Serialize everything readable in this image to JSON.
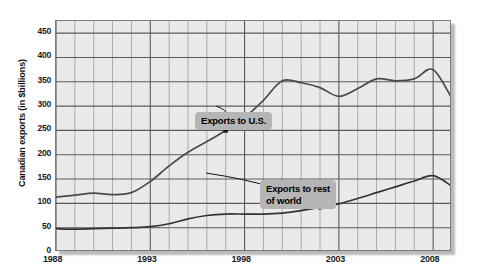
{
  "chart_data": {
    "type": "line",
    "title": "",
    "xlabel": "",
    "ylabel": "Canadian exports (in $billions)",
    "xlim": [
      1988,
      2009
    ],
    "ylim": [
      0,
      475
    ],
    "grid": true,
    "legend_position": "inline-callouts",
    "x": [
      1988,
      1989,
      1990,
      1991,
      1992,
      1993,
      1994,
      1995,
      1996,
      1997,
      1998,
      1999,
      2000,
      2001,
      2002,
      2003,
      2004,
      2005,
      2006,
      2007,
      2008,
      2009
    ],
    "y_ticks": [
      0,
      50,
      100,
      150,
      200,
      250,
      300,
      350,
      400,
      450
    ],
    "x_ticks": [
      1988,
      1993,
      1998,
      2003,
      2008
    ],
    "x_tick_labels": [
      "1988",
      "1993",
      "1998",
      "2003",
      "2008"
    ],
    "y_tick_labels": [
      "0",
      "50",
      "100",
      "150",
      "200",
      "250",
      "300",
      "350",
      "400",
      "450"
    ],
    "series": [
      {
        "name": "Exports to U.S.",
        "color": "#4a4a4a",
        "values": [
          113,
          117,
          121,
          118,
          122,
          145,
          177,
          205,
          227,
          250,
          276,
          312,
          352,
          348,
          338,
          320,
          336,
          356,
          352,
          356,
          375,
          315
        ]
      },
      {
        "name": "Exports to rest of world",
        "color": "#333333",
        "values": [
          48,
          47,
          48,
          49,
          50,
          52,
          58,
          68,
          75,
          78,
          78,
          78,
          80,
          85,
          92,
          99,
          110,
          122,
          134,
          146,
          157,
          135
        ]
      }
    ],
    "annotations": [
      {
        "text": "Exports to U.S.",
        "target_year": 1997,
        "target_value": 250
      },
      {
        "text": "Exports to rest\nof world",
        "target_year": 2002,
        "target_value": 92
      }
    ]
  }
}
